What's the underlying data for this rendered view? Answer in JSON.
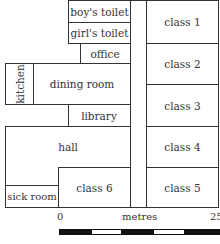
{
  "rooms": {
    "boys_toilet": "boy's toilet",
    "girls_toilet": "girl's toilet",
    "office": "office",
    "kitchen": "kitchen",
    "dining_room": "dining room",
    "library": "library",
    "hall": "hall",
    "sick_room": "sick room",
    "class6": "class 6",
    "class1": "class 1",
    "class2": "class 2",
    "class3": "class 3",
    "class4": "class 4",
    "class5": "class 5"
  },
  "scale": {
    "label": "metres",
    "start": "0",
    "end": "25",
    "segments": [
      "black",
      "white",
      "black",
      "white",
      "black"
    ]
  }
}
